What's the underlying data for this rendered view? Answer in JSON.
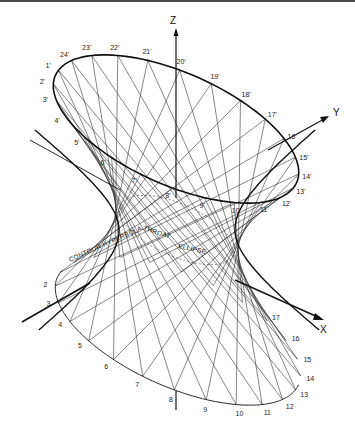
{
  "figure": {
    "axes": {
      "z": "Z",
      "y": "Y",
      "x": "X"
    },
    "top_ellipse_labels": [
      "1'",
      "2'",
      "3'",
      "4'",
      "5'",
      "6'",
      "7'",
      "8'",
      "9'",
      "10'",
      "11'",
      "12'",
      "13'",
      "14'",
      "15'",
      "16'",
      "17'",
      "18'",
      "19'",
      "20'",
      "21'",
      "22'",
      "23'",
      "24'"
    ],
    "bottom_ellipse_labels": [
      "1",
      "2",
      "3",
      "4",
      "5",
      "6",
      "7",
      "8",
      "9",
      "10",
      "11",
      "12",
      "13",
      "14",
      "15",
      "16",
      "17",
      "18",
      "19",
      "20",
      "21",
      "22",
      "23",
      "24"
    ],
    "annotations": {
      "contour": "CONTOUR HYPERBOLA",
      "throat": "THROAT",
      "ellipse": "ELLIPSE"
    },
    "colors": {
      "line": "#222222",
      "background": "#ffffff",
      "frame": "#4a4a4a"
    }
  }
}
